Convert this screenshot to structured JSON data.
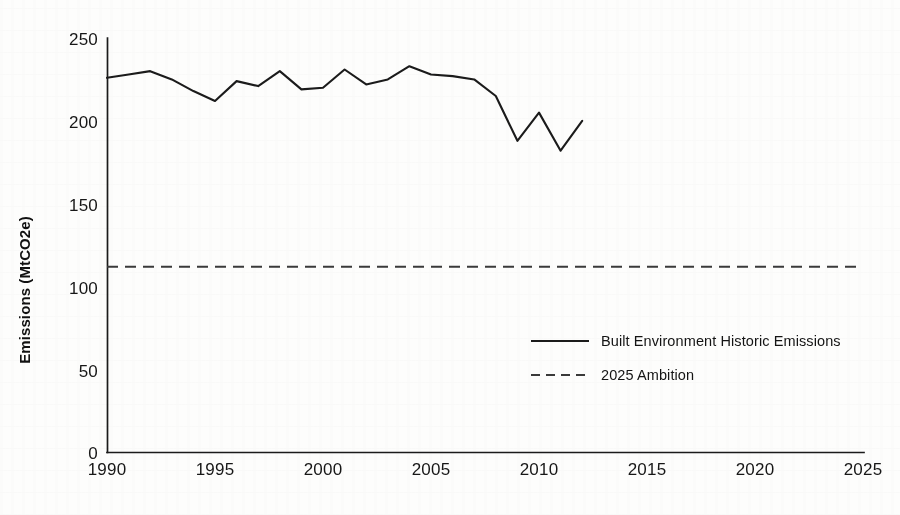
{
  "chart_data": {
    "type": "line",
    "title": "",
    "xlabel": "",
    "ylabel": "Emissions (MtCO2e)",
    "xlim": [
      1990,
      2025
    ],
    "ylim": [
      0,
      250
    ],
    "grid": false,
    "legend_position": "center-right",
    "x_ticks": [
      1990,
      1995,
      2000,
      2005,
      2010,
      2015,
      2020,
      2025
    ],
    "x_tick_labels": [
      "1990",
      "1995",
      "2000",
      "2005",
      "2010",
      "2015",
      "2020",
      "2025"
    ],
    "y_ticks": [
      0,
      50,
      100,
      150,
      200,
      250
    ],
    "y_tick_labels": [
      "0",
      "50",
      "100",
      "150",
      "200",
      "250"
    ],
    "series": [
      {
        "name": "Built Environment Historic Emissions",
        "style": "solid",
        "color": "#1b1b1b",
        "x": [
          1990,
          1991,
          1992,
          1993,
          1994,
          1995,
          1996,
          1997,
          1998,
          1999,
          2000,
          2001,
          2002,
          2003,
          2004,
          2005,
          2006,
          2007,
          2008,
          2009,
          2010,
          2011,
          2012
        ],
        "values": [
          226,
          228,
          230,
          225,
          218,
          212,
          224,
          221,
          230,
          219,
          220,
          231,
          222,
          225,
          233,
          228,
          227,
          225,
          215,
          188,
          205,
          182,
          200
        ]
      },
      {
        "name": "2025 Ambition",
        "style": "dashed",
        "color": "#3a3a3a",
        "x": [
          1990,
          2025
        ],
        "values": [
          112,
          112
        ]
      }
    ],
    "legend": [
      {
        "label": "Built Environment Historic Emissions",
        "style": "solid",
        "color": "#1b1b1b"
      },
      {
        "label": "2025 Ambition",
        "style": "dashed",
        "color": "#3a3a3a"
      }
    ]
  }
}
